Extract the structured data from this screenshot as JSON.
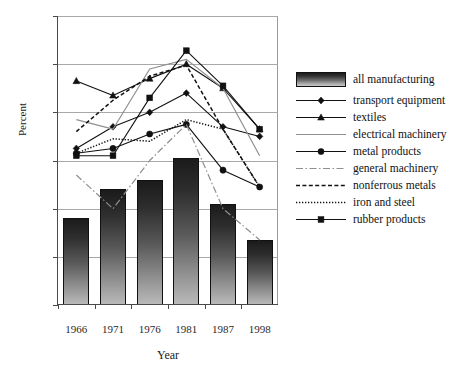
{
  "chart_data": {
    "type": "line",
    "title": "",
    "xlabel": "Year",
    "ylabel": "Percent",
    "categories": [
      "1966",
      "1971",
      "1976",
      "1981",
      "1987",
      "1998"
    ],
    "ylim": [
      35,
      95
    ],
    "yticks": [
      35,
      45,
      55,
      65,
      75,
      85,
      95
    ],
    "grid": true,
    "legend_position": "right",
    "bar_series": {
      "name": "all manufacturing",
      "type": "bar",
      "values": [
        53.0,
        59.0,
        61.0,
        65.5,
        56.0,
        48.5
      ]
    },
    "series": [
      {
        "name": "transport equipment",
        "style": "solid-diamond",
        "values": [
          67.5,
          72.0,
          75.0,
          79.0,
          72.0,
          70.0
        ]
      },
      {
        "name": "textiles",
        "style": "solid-triangle",
        "values": [
          81.5,
          78.5,
          82.0,
          85.0,
          80.0,
          71.5
        ]
      },
      {
        "name": "electrical machinery",
        "style": "solid-gray",
        "values": [
          73.5,
          71.5,
          84.0,
          86.0,
          80.0,
          66.0
        ]
      },
      {
        "name": "metal products",
        "style": "solid-circle",
        "values": [
          66.5,
          67.5,
          70.5,
          72.5,
          63.0,
          59.5
        ]
      },
      {
        "name": "general machinery",
        "style": "dash-dot",
        "values": [
          62.0,
          55.0,
          65.0,
          72.5,
          55.0,
          48.5
        ]
      },
      {
        "name": "nonferrous metals",
        "style": "dashed",
        "values": [
          71.0,
          77.5,
          82.5,
          84.8,
          71.5,
          59.5
        ]
      },
      {
        "name": "iron and steel",
        "style": "dotted",
        "values": [
          66.5,
          69.5,
          69.0,
          73.5,
          71.5,
          59.5
        ]
      },
      {
        "name": "rubber products",
        "style": "solid-square",
        "values": [
          66.0,
          66.0,
          78.0,
          87.8,
          80.5,
          71.5
        ]
      }
    ]
  },
  "legend": {
    "entries": [
      {
        "label": "all manufacturing"
      },
      {
        "label": "transport equipment"
      },
      {
        "label": "textiles"
      },
      {
        "label": "electrical machinery"
      },
      {
        "label": "metal products"
      },
      {
        "label": "general machinery"
      },
      {
        "label": "nonferrous metals"
      },
      {
        "label": "iron and steel"
      },
      {
        "label": "rubber products"
      }
    ]
  },
  "axes": {
    "y_title": "Percent",
    "x_title": "Year",
    "y_labels": [
      "95",
      "85",
      "75",
      "65",
      "55",
      "45",
      "35"
    ],
    "x_labels": [
      "1966",
      "1971",
      "1976",
      "1981",
      "1987",
      "1998"
    ]
  },
  "colors": {
    "line_dark": "#111111",
    "line_gray": "#8f8f8f",
    "grid": "#a8a8a8",
    "axis": "#4a4a4a",
    "background": "#ffffff"
  }
}
